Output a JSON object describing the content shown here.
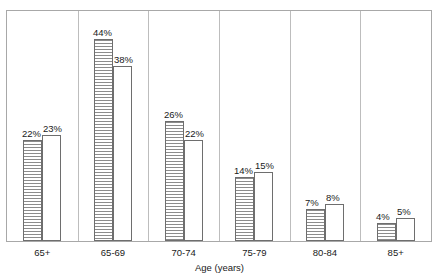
{
  "chart_data": {
    "type": "bar",
    "title": "",
    "subtitle": "",
    "xlabel": "Age (years)",
    "ylabel": "",
    "categories": [
      "65+",
      "65-69",
      "70-74",
      "75-79",
      "80-84",
      "85+"
    ],
    "series": [
      {
        "name": "series-1",
        "style": "horizontal-hatch",
        "values": [
          22,
          44,
          26,
          14,
          7,
          4
        ],
        "labels": [
          "22%",
          "44%",
          "26%",
          "14%",
          "7%",
          "4%"
        ]
      },
      {
        "name": "series-2",
        "style": "open-white",
        "values": [
          23,
          38,
          22,
          15,
          8,
          5
        ],
        "labels": [
          "23%",
          "38%",
          "22%",
          "15%",
          "8%",
          "5%"
        ]
      }
    ],
    "ylim": [
      0,
      50
    ],
    "grid": false,
    "legend": "none",
    "axis_line_color": "#a8a8a8",
    "bar_outline_color": "#6e6e6e",
    "hatch_color": "#8c8c8c",
    "background": "#ffffff"
  },
  "axis": {
    "x_title": "Age (years)"
  }
}
